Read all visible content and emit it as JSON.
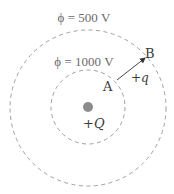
{
  "diagram": {
    "equipotentials": [
      {
        "label": "ϕ = 500 V",
        "potential": 500,
        "unit": "V",
        "cx": 88,
        "cy": 108,
        "r": 78
      },
      {
        "label": "ϕ = 1000 V",
        "potential": 1000,
        "unit": "V",
        "cx": 88,
        "cy": 107,
        "r": 37
      }
    ],
    "source_charge": {
      "label": "+Q",
      "cx": 88,
      "cy": 107,
      "r": 5,
      "color": "#8c8c8c"
    },
    "test_charge": {
      "label": "+q"
    },
    "points": [
      {
        "label": "A"
      },
      {
        "label": "B"
      }
    ],
    "colors": {
      "circle_stroke": "#9a9a9a",
      "text": "#3a3a3a",
      "label_text": "#6a6a6a",
      "arrow": "#333333"
    }
  }
}
